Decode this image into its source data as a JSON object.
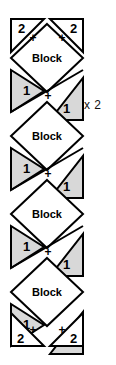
{
  "diagram": {
    "canvas": {
      "width": 116,
      "height": 365
    },
    "colors": {
      "background": "#ffffff",
      "stroke": "#000000",
      "triangle_fill": "#d8d8d8",
      "block_fill": "#ffffff",
      "text": "#111111"
    },
    "geometry": {
      "strip_left": 10,
      "strip_right": 84,
      "strip_width": 74,
      "unit_height": 78,
      "top_y": 18,
      "bottom_y": 348
    },
    "labels": {
      "block": "Block",
      "piece_one": "1",
      "piece_two": "2",
      "plus": "+",
      "repeat": "x 2"
    },
    "repeat_annotation": {
      "text": "x 2",
      "x": 84,
      "y": 98
    },
    "corner_triangles": [
      {
        "id": "top-left",
        "label": "2",
        "cx": 22,
        "cy": 30
      },
      {
        "id": "top-right",
        "label": "2",
        "cx": 72,
        "cy": 30
      },
      {
        "id": "bottom-left",
        "label": "2",
        "cx": 22,
        "cy": 336
      },
      {
        "id": "bottom-right",
        "label": "2",
        "cx": 72,
        "cy": 336
      }
    ],
    "blocks": [
      {
        "id": "block-1",
        "label": "Block",
        "cx": 47,
        "cy": 57
      },
      {
        "id": "block-2",
        "label": "Block",
        "cx": 47,
        "cy": 135
      },
      {
        "id": "block-3",
        "label": "Block",
        "cx": 47,
        "cy": 213
      },
      {
        "id": "block-4",
        "label": "Block",
        "cx": 47,
        "cy": 291
      }
    ],
    "triangle_pairs": [
      {
        "id": "pair-1",
        "left_label": "1",
        "right_label": "1",
        "left_cx": 27,
        "left_cy": 88,
        "right_cx": 67,
        "right_cy": 104,
        "plus_x": 47,
        "plus_y": 96
      },
      {
        "id": "pair-2",
        "left_label": "1",
        "right_label": "1",
        "left_cx": 27,
        "left_cy": 166,
        "right_cx": 67,
        "right_cy": 182,
        "plus_x": 47,
        "plus_y": 174
      },
      {
        "id": "pair-3",
        "left_label": "1",
        "right_label": "1",
        "left_cx": 27,
        "left_cy": 244,
        "right_cx": 67,
        "right_cy": 260,
        "plus_x": 47,
        "plus_y": 252
      },
      {
        "id": "pair-4",
        "left_label": "1",
        "right_label": "1",
        "left_cx": 27,
        "left_cy": 322,
        "right_cx": 67,
        "right_cy": 338,
        "plus_x": 47,
        "plus_y": 330
      }
    ],
    "plus_marks": [
      {
        "id": "plus-top-left",
        "label": "+",
        "x": 33,
        "y": 37
      },
      {
        "id": "plus-top-right",
        "label": "+",
        "x": 61,
        "y": 37
      },
      {
        "id": "plus-bottom-left",
        "label": "+",
        "x": 33,
        "y": 329
      },
      {
        "id": "plus-bottom-right",
        "label": "+",
        "x": 61,
        "y": 329
      }
    ]
  }
}
